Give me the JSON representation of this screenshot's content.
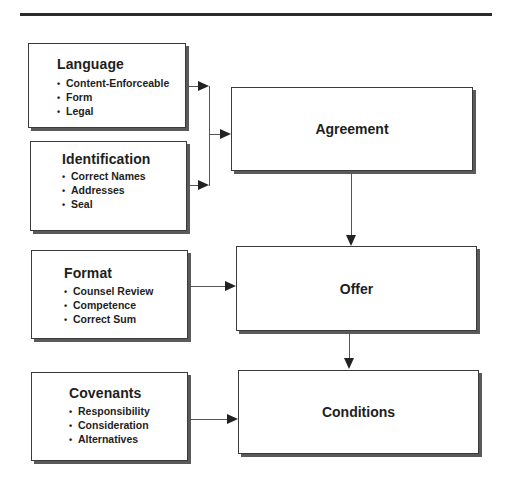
{
  "diagram": {
    "sources": [
      {
        "title": "Language",
        "items": [
          "Content-Enforceable",
          "Form",
          "Legal"
        ]
      },
      {
        "title": "Identification",
        "items": [
          "Correct Names",
          "Addresses",
          "Seal"
        ]
      },
      {
        "title": "Format",
        "items": [
          "Counsel Review",
          "Competence",
          "Correct Sum"
        ]
      },
      {
        "title": "Covenants",
        "items": [
          "Responsibility",
          "Consideration",
          "Alternatives"
        ]
      }
    ],
    "stages": [
      {
        "label": "Agreement"
      },
      {
        "label": "Offer"
      },
      {
        "label": "Conditions"
      }
    ],
    "edges": [
      {
        "from": "Language",
        "to": "Agreement"
      },
      {
        "from": "Identification",
        "to": "Agreement"
      },
      {
        "from": "Agreement",
        "to": "Offer"
      },
      {
        "from": "Format",
        "to": "Offer"
      },
      {
        "from": "Offer",
        "to": "Conditions"
      },
      {
        "from": "Covenants",
        "to": "Conditions"
      }
    ]
  }
}
